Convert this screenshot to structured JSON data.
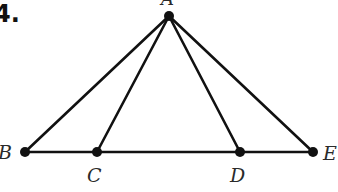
{
  "problem_label": "4.",
  "figure": {
    "type": "triangle-with-cevians",
    "points": {
      "A": {
        "label": "A",
        "x": 169,
        "y": 16
      },
      "B": {
        "label": "B",
        "x": 25,
        "y": 152
      },
      "C": {
        "label": "C",
        "x": 97,
        "y": 152
      },
      "D": {
        "label": "D",
        "x": 240,
        "y": 152
      },
      "E": {
        "label": "E",
        "x": 313,
        "y": 152
      }
    },
    "segments": [
      "AB",
      "AC",
      "AD",
      "AE",
      "BE"
    ],
    "collinear": [
      "B",
      "C",
      "D",
      "E"
    ],
    "colors": {
      "stroke": "#111111",
      "label": "#2a2a2a"
    }
  }
}
